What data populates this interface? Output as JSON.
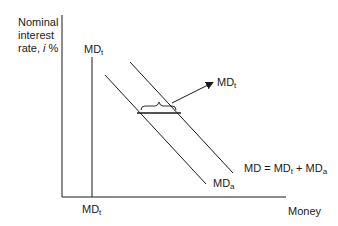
{
  "diagram": {
    "type": "money-demand-curves",
    "y_axis_label": {
      "line1": "Nominal",
      "line2": "interest",
      "line3_prefix": "rate, ",
      "line3_var": "i",
      "line3_suffix": " %"
    },
    "x_axis_label": "Money",
    "curves": [
      {
        "id": "md_t",
        "base": "MD",
        "sub": "t",
        "description": "transactions demand (vertical)"
      },
      {
        "id": "md_a",
        "base": "MD",
        "sub": "a",
        "description": "asset demand (downward sloping)"
      },
      {
        "id": "md_total",
        "base": "MD = MD",
        "sub1": "t",
        "mid": " + MD",
        "sub2": "a",
        "description": "total money demand"
      }
    ],
    "labels": {
      "md_t_top": {
        "base": "MD",
        "sub": "t"
      },
      "md_t_bottom": {
        "base": "MD",
        "sub": "t"
      },
      "md_t_arrow": {
        "base": "MD",
        "sub": "t"
      },
      "md_a": {
        "base": "MD",
        "sub": "a"
      },
      "md_total": {
        "base": "MD = MD",
        "sub1": "t",
        "mid": " + MD",
        "sub2": "a"
      }
    },
    "colors": {
      "line": "#1a1a1a",
      "background": "#ffffff"
    }
  }
}
